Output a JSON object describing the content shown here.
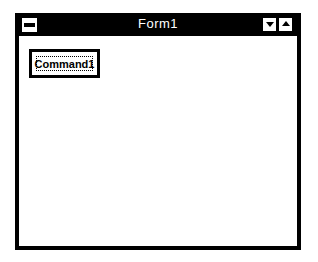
{
  "window": {
    "title": "Form1",
    "controls": {
      "system_menu_icon": "system-menu-icon",
      "minimize_icon": "minimize-arrow-icon",
      "maximize_icon": "maximize-arrow-icon"
    }
  },
  "form": {
    "command_button": {
      "label": "Command1"
    }
  },
  "colors": {
    "titlebar": "#000000",
    "title_text": "#ffffff",
    "client_background": "#ffffff",
    "border": "#000000"
  }
}
